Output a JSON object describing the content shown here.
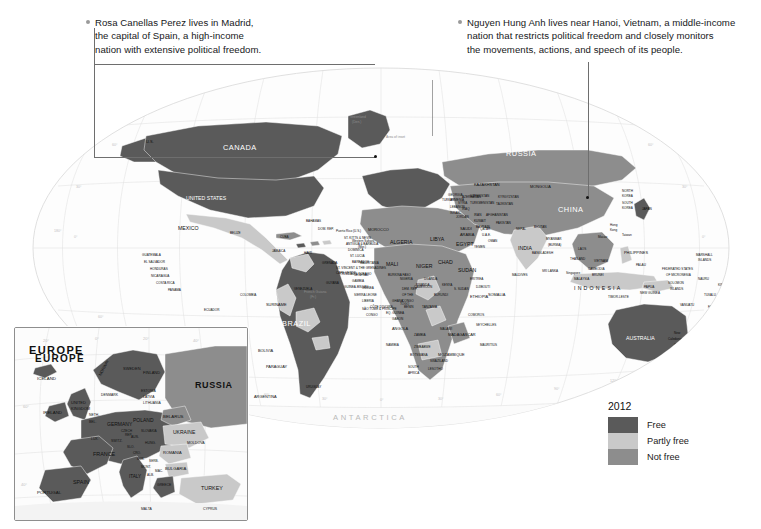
{
  "figure": {
    "title_visible": false,
    "background": "#ffffff"
  },
  "annotations": [
    {
      "id": "madrid",
      "text": "Rosa Canellas Perez lives in Madrid, the capital of Spain, a high-income nation with extensive political freedom.",
      "lines": [
        "Rosa Canellas Perez lives in Madrid,",
        "the capital of Spain, a high-income",
        "nation with extensive political freedom."
      ],
      "target_place": "Madrid, Spain"
    },
    {
      "id": "hanoi",
      "text": "Nguyen Hung Anh lives near Hanoi, Vietnam, a middle-income nation that restricts political freedom and closely monitors the movements, actions, and speech of its people.",
      "lines": [
        "Nguyen Hung Anh lives near Hanoi, Vietnam, a middle-income",
        "nation that restricts political freedom and closely monitors",
        "the movements, actions, and speech of its people."
      ],
      "target_place": "Hanoi, Vietnam"
    }
  ],
  "legend": {
    "year": "2012",
    "items": [
      {
        "label": "Free",
        "color": "#5a5a5a"
      },
      {
        "label": "Partly free",
        "color": "#c9c9c9"
      },
      {
        "label": "Not free",
        "color": "#8d8d8d"
      }
    ]
  },
  "inset": {
    "title": "EUROPE",
    "note": "Area of inset",
    "grid_labels": [
      "20°",
      "0°",
      "20°",
      "40°"
    ],
    "labels": [
      "EUROPE",
      "ICELAND",
      "IRELAND",
      "UNITED KINGDOM",
      "NORWAY",
      "SWEDEN",
      "FINLAND",
      "ESTONIA",
      "LATVIA",
      "LITHUANIA",
      "DENMARK",
      "NETH.",
      "BELGIUM",
      "GERMANY",
      "POLAND",
      "BELARUS",
      "RUSSIA",
      "UKRAINE",
      "MOLDOVA",
      "ROMANIA",
      "BULGARIA",
      "TURKEY",
      "GREECE",
      "ITALY",
      "FRANCE",
      "SPAIN",
      "PORTUGAL",
      "LUX.",
      "SWITZ.",
      "AUS.",
      "HUNG.",
      "CZECH REP.",
      "SLOVAKIA",
      "SLO.",
      "CRO.",
      "BOS.",
      "SERB.",
      "MONT.",
      "ALB.",
      "MAC.",
      "MALTA",
      "CYPRUS"
    ]
  },
  "map": {
    "ocean_label": "ANTARCTICA",
    "inset_note": "Area of inset",
    "longitude_labels": [
      "150°",
      "120°",
      "90°",
      "60°",
      "30°",
      "0°",
      "30°",
      "60°",
      "90°",
      "120°",
      "150°"
    ],
    "latitude_labels": [
      "60°",
      "30°",
      "0°",
      "30°",
      "60°"
    ],
    "country_labels": [
      "CANADA",
      "UNITED STATES",
      "MEXICO",
      "U.S.",
      "Greenland (Den.)",
      "BELIZE",
      "GUATEMALA",
      "EL SALVADOR",
      "HONDURAS",
      "NICARAGUA",
      "COSTA RICA",
      "PANAMA",
      "CUBA",
      "JAMAICA",
      "HAITI",
      "DOM. REP.",
      "BAHAMAS",
      "Puerto Rico (U.S.)",
      "ST. KITTS & NEVIS",
      "ANTIGUA & BARBUDA",
      "DOMINICA",
      "ST. LUCIA",
      "BARBADOS",
      "ST. VINCENT & THE GRENADINES",
      "TRINIDAD & TOBAGO",
      "GRENADA",
      "COLOMBIA",
      "VENEZUELA",
      "GUYANA",
      "SURINAME",
      "French Guiana (Fr.)",
      "ECUADOR",
      "PERU",
      "BRAZIL",
      "BOLIVIA",
      "PARAGUAY",
      "CHILE",
      "ARGENTINA",
      "URUGUAY",
      "MOROCCO",
      "Western Sahara (Mor.)",
      "ALGERIA",
      "TUNISIA",
      "LIBYA",
      "EGYPT",
      "MAURITANIA",
      "MALI",
      "NIGER",
      "CHAD",
      "SUDAN",
      "S. SUDAN",
      "ERITREA",
      "DJIBOUTI",
      "ETHIOPIA",
      "SOMALIA",
      "SENEGAL",
      "GAMBIA",
      "GUINEA-BISSAU",
      "GUINEA",
      "SIERRA LEONE",
      "LIBERIA",
      "CÔTE D'IVOIRE",
      "BURKINA FASO",
      "GHANA",
      "TOGO",
      "BENIN",
      "NIGERIA",
      "CAMEROON",
      "EQ. GUINEA",
      "GABON",
      "CONGO",
      "DEM. REP. OF THE CONGO",
      "CENTRAL AFRICAN REP.",
      "UGANDA",
      "KENYA",
      "RWANDA",
      "BURUNDI",
      "TANZANIA",
      "ANGOLA",
      "ZAMBIA",
      "MALAWI",
      "MOZAMBIQUE",
      "ZIMBABWE",
      "BOTSWANA",
      "NAMIBIA",
      "SOUTH AFRICA",
      "SWAZILAND",
      "LESOTHO",
      "MADAGASCAR",
      "MAURITIUS",
      "COMOROS",
      "SEYCHELLES",
      "SÃO TOMÉ & PRÍNCIPE",
      "CAPE VERDE",
      "RUSSIA",
      "KAZAKHSTAN",
      "UZBEKISTAN",
      "TURKMENISTAN",
      "KYRGYZSTAN",
      "TAJIKISTAN",
      "AFGHANISTAN",
      "PAKISTAN",
      "IRAN",
      "IRAQ",
      "SYRIA",
      "LEBANON",
      "ISRAEL",
      "JORDAN",
      "SAUDI ARABIA",
      "KUWAIT",
      "QATAR",
      "U.A.E.",
      "OMAN",
      "YEMEN",
      "BAHRAIN",
      "GEORGIA",
      "ARMENIA",
      "AZERBAIJAN",
      "TURKEY",
      "MONGOLIA",
      "CHINA",
      "NORTH KOREA",
      "SOUTH KOREA",
      "JAPAN",
      "INDIA",
      "NEPAL",
      "BHUTAN",
      "BANGLADESH",
      "MYANMAR (BURMA)",
      "SRI LANKA",
      "MALDIVES",
      "LAOS",
      "THAILAND",
      "VIETNAM",
      "CAMBODIA",
      "MALAYSIA",
      "BRUNEI",
      "SINGAPORE",
      "INDONESIA",
      "PHILIPPINES",
      "TIMOR-LESTE",
      "TAIWAN",
      "Hong Kong",
      "Macao",
      "PALAU",
      "FEDERATED STATES OF MICRONESIA",
      "MARSHALL ISLANDS",
      "NAURU",
      "KIRIBATI",
      "TUVALU",
      "SOLOMON ISLANDS",
      "PAPUA NEW GUINEA",
      "VANUATU",
      "FIJI",
      "New Caledonia (Fr.)",
      "AUSTRALIA",
      "NEW ZEALAND",
      "TONGA",
      "SAMOA",
      "ANTARCTICA"
    ]
  }
}
